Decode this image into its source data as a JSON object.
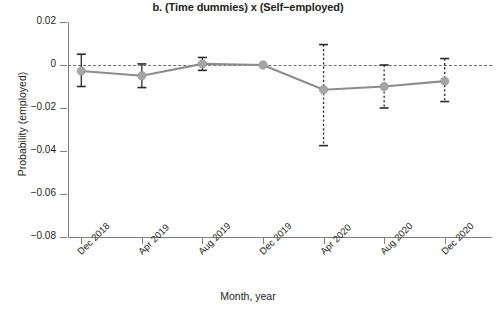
{
  "chart_data": {
    "type": "line",
    "title": "b. (Time dummies) x (Self−employed)",
    "xlabel": "Month, year",
    "ylabel": "Probability (employed)",
    "categories": [
      "Dec 2018",
      "Apr 2019",
      "Aug 2019",
      "Dec 2019",
      "Apr 2020",
      "Aug 2020",
      "Dec 2020"
    ],
    "values": [
      -0.0028,
      -0.005,
      0.0005,
      0.0,
      -0.0115,
      -0.01,
      -0.0075
    ],
    "ci_low": [
      -0.01,
      -0.0105,
      -0.0025,
      0.0,
      -0.0375,
      -0.02,
      -0.017
    ],
    "ci_high": [
      0.005,
      0.0005,
      0.0035,
      0.0,
      0.0095,
      0.0,
      0.003
    ],
    "error_bar_style": [
      "solid",
      "solid",
      "solid",
      "none",
      "dotted",
      "dotted",
      "dotted"
    ],
    "ylim": [
      -0.08,
      0.02
    ],
    "yticks": [
      0.02,
      0,
      -0.02,
      -0.04,
      -0.06,
      -0.08
    ],
    "ytick_labels": [
      "0.02",
      "0",
      "−0.02",
      "−0.04",
      "−0.06",
      "−0.08"
    ],
    "reference_point": "Dec 2019",
    "grid": false,
    "legend": "none",
    "zero_reference_line": 0,
    "colors": {
      "marker": "#a6a6a6",
      "line": "#8c8c8c",
      "error_bar": "#2b2b2b",
      "axis": "#808080",
      "zero_line": "#6f6f6f",
      "text": "#231f20",
      "background": "#ffffff"
    }
  }
}
